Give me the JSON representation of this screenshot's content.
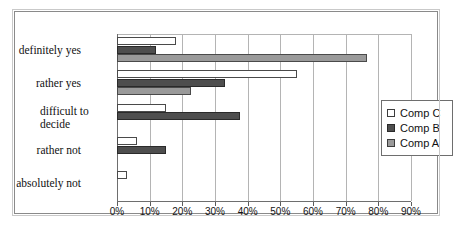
{
  "chart_data": {
    "type": "bar",
    "orientation": "horizontal",
    "title": "",
    "xlabel": "",
    "ylabel": "",
    "xlim": [
      0,
      90
    ],
    "xtick_labels": [
      "0%",
      "10%",
      "20%",
      "30%",
      "40%",
      "50%",
      "60%",
      "70%",
      "80%",
      "90%"
    ],
    "xticks": [
      0,
      10,
      20,
      30,
      40,
      50,
      60,
      70,
      80,
      90
    ],
    "grid": true,
    "legend_position": "right",
    "categories": [
      "definitely yes",
      "rather yes",
      "difficult to decide",
      "rather not",
      "absolutely not"
    ],
    "series": [
      {
        "name": "Comp A",
        "color": "#9a9a9a",
        "values": [
          76.5,
          22.5,
          0,
          0,
          0
        ]
      },
      {
        "name": "Comp B",
        "color": "#4e4e4e",
        "values": [
          12.0,
          33.0,
          37.5,
          15.0,
          0
        ]
      },
      {
        "name": "Comp C",
        "color": "#ffffff",
        "values": [
          18.0,
          55.0,
          15.0,
          6.0,
          3.0
        ]
      }
    ]
  },
  "legend": {
    "entries": [
      {
        "label": "Comp C",
        "swatch": "series-c-swatch"
      },
      {
        "label": "Comp B",
        "swatch": "series-b-swatch"
      },
      {
        "label": "Comp A",
        "swatch": "series-a-swatch"
      }
    ]
  },
  "axis": {
    "ticks": [
      {
        "label": "0%",
        "value": 0
      },
      {
        "label": "10%",
        "value": 10
      },
      {
        "label": "20%",
        "value": 20
      },
      {
        "label": "30%",
        "value": 30
      },
      {
        "label": "40%",
        "value": 40
      },
      {
        "label": "50%",
        "value": 50
      },
      {
        "label": "60%",
        "value": 60
      },
      {
        "label": "70%",
        "value": 70
      },
      {
        "label": "80%",
        "value": 80
      },
      {
        "label": "90%",
        "value": 90
      }
    ]
  },
  "categories": [
    {
      "label": "definitely yes",
      "wrapped": false
    },
    {
      "label": "rather yes",
      "wrapped": false
    },
    {
      "label": "difficult to decide",
      "wrapped": true
    },
    {
      "label": "rather not",
      "wrapped": false
    },
    {
      "label": "absolutely not",
      "wrapped": false
    }
  ]
}
